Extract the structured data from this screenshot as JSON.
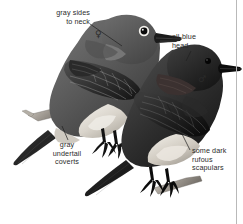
{
  "plate": {
    "width": 243,
    "height": 224,
    "background": "#ffffff",
    "rule_color": "#b9b9b9",
    "ink_color": "#2b2b2b",
    "subject": "two perched bluebirds, grayscale field-guide illustration",
    "birds": [
      {
        "id": "upper-bird",
        "sex_symbol": "♀",
        "sex": "female",
        "position": "upper-left, facing right"
      },
      {
        "id": "lower-bird",
        "sex_symbol": "♂",
        "sex": "male",
        "position": "lower-right, facing right"
      }
    ]
  },
  "annotations": [
    {
      "id": "gray-sides-to-neck",
      "text": "gray sides\nto neck",
      "align": "right",
      "x": 42,
      "y": 9,
      "width": 48,
      "leader": {
        "x1": 90,
        "y1": 24,
        "x2": 122,
        "y2": 46
      }
    },
    {
      "id": "all-blue-head",
      "text": "all-blue\nhead",
      "align": "left",
      "x": 172,
      "y": 33,
      "width": 50,
      "leader": {
        "x1": 190,
        "y1": 52,
        "x2": 186,
        "y2": 62
      }
    },
    {
      "id": "gray-undertail-coverts",
      "text": "gray\nundertail\ncoverts",
      "align": "center",
      "x": 44,
      "y": 141,
      "width": 45,
      "leader": {
        "x1": 68,
        "y1": 140,
        "x2": 62,
        "y2": 126
      }
    },
    {
      "id": "some-dark-rufous-scapulars",
      "text": "some dark\nrufous\nscapulars",
      "align": "left",
      "x": 192,
      "y": 147,
      "width": 50,
      "leader": {
        "x1": 191,
        "y1": 150,
        "x2": 167,
        "y2": 104
      }
    }
  ],
  "symbols": [
    {
      "id": "female-symbol",
      "glyph": "♀",
      "x": 95,
      "y": 33
    },
    {
      "id": "male-symbol",
      "glyph": "♂",
      "x": 198,
      "y": 78
    }
  ]
}
